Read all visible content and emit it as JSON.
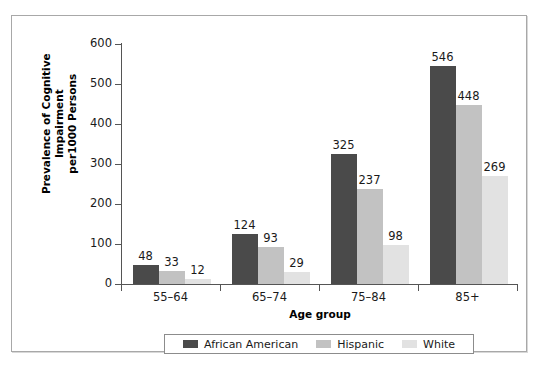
{
  "chart_data": {
    "type": "bar",
    "title": "",
    "subtitle": "",
    "xlabel": "Age group",
    "ylabel": "Prevalence of Cognitive Impairment per1000 Persons",
    "ylabel_line1": "Prevalence of Cognitive Impairment",
    "ylabel_line2": "per1000 Persons",
    "categories": [
      "55–64",
      "65–74",
      "75–84",
      "85+"
    ],
    "series": [
      {
        "name": "African American",
        "color": "#4a4a4a",
        "values": [
          48,
          124,
          325,
          546
        ]
      },
      {
        "name": "Hispanic",
        "color": "#c2c2c2",
        "values": [
          33,
          93,
          237,
          448
        ]
      },
      {
        "name": "White",
        "color": "#e2e2e2",
        "values": [
          12,
          29,
          98,
          269
        ]
      }
    ],
    "ylim": [
      0,
      600
    ],
    "yticks": [
      0,
      100,
      200,
      300,
      400,
      500,
      600
    ],
    "ytick_labels": [
      "0",
      "100",
      "200",
      "300",
      "400",
      "500",
      "600"
    ],
    "grid": false,
    "legend_position": "bottom",
    "data_labels": true,
    "frame": {
      "border_color": "#a8a8a8",
      "background": "#ffffff"
    },
    "axis_color": "#555555"
  }
}
